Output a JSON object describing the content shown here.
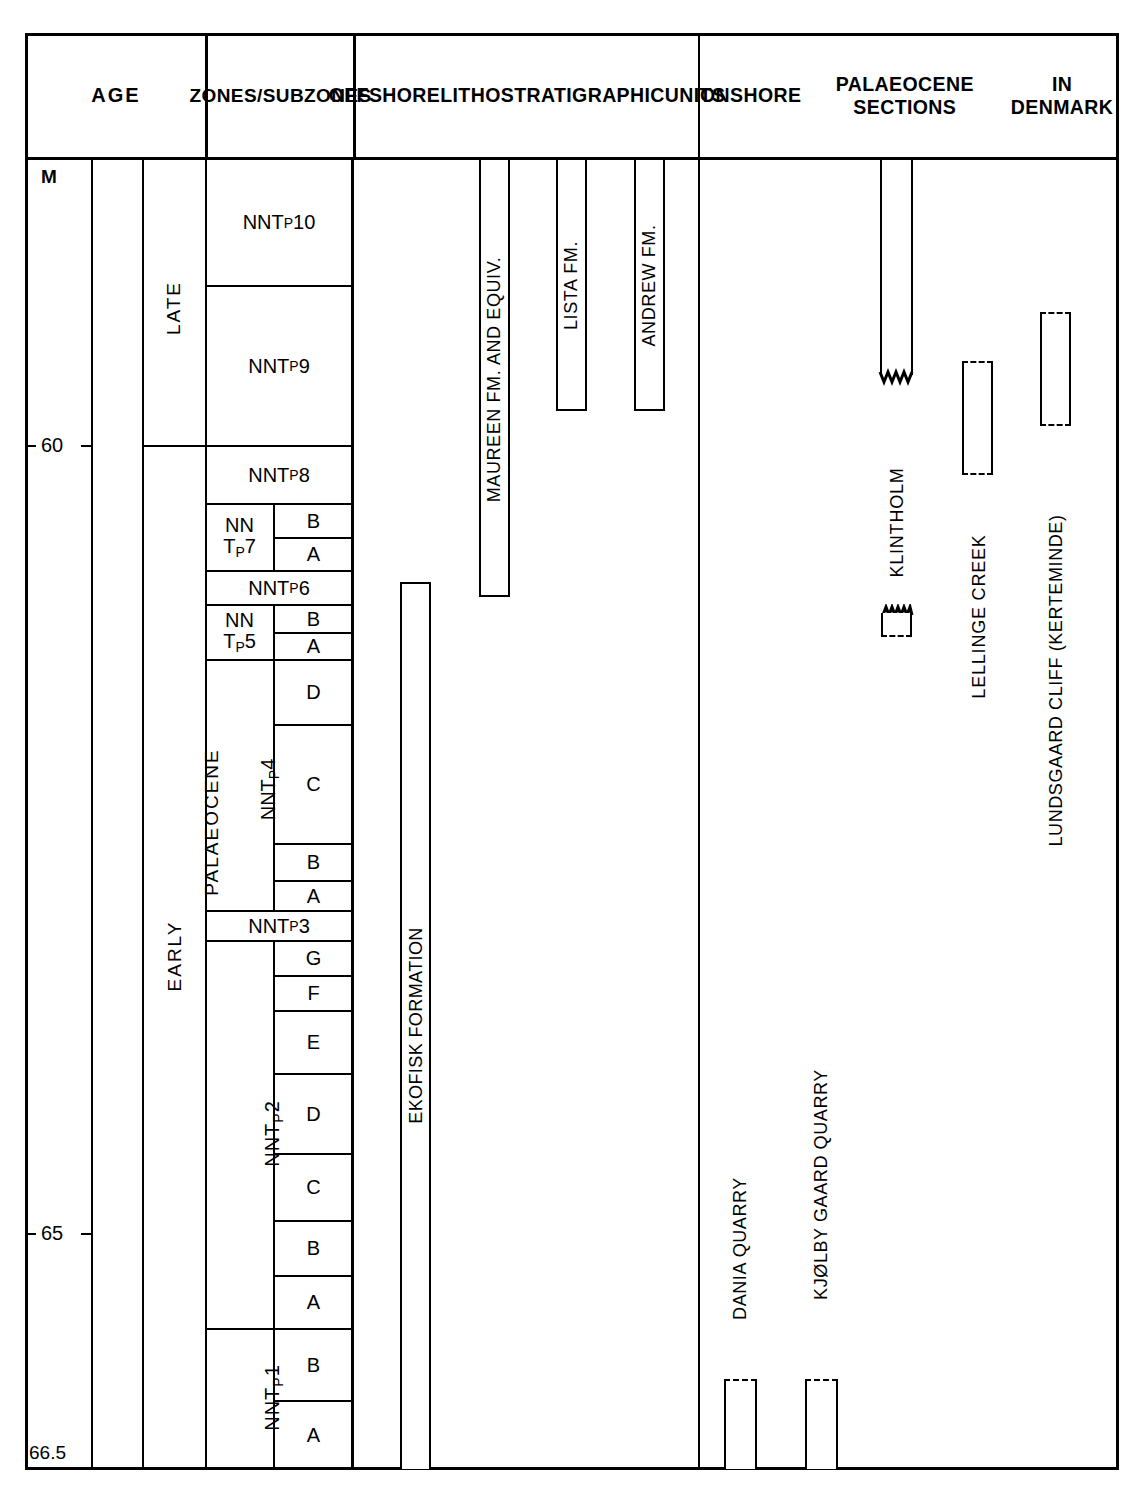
{
  "figure": {
    "type": "stratigraphic_correlation_chart",
    "background": "#ffffff",
    "line_color": "#000000"
  },
  "headers": {
    "age": "AGE",
    "zones": "ZONES/\nSUBZONES",
    "offshore": "OFFSHORE\nLITHOSTRATIGRAPHIC\nUNITS",
    "onshore": "ONSHORE\nPALAEOCENE SECTIONS\nIN DENMARK"
  },
  "axis": {
    "unit_label": "M",
    "ticks": [
      {
        "label": "60",
        "value": 60
      },
      {
        "label": "65",
        "value": 65
      }
    ],
    "bottom_label": "66.5",
    "top_value": 58.0,
    "bottom_value": 66.5
  },
  "age": {
    "system": "PALAEOCENE",
    "epochs": [
      {
        "label": "LATE"
      },
      {
        "label": "EARLY"
      }
    ]
  },
  "zones": [
    {
      "zone": "NNT",
      "sub": "P",
      "num": "10",
      "subzones": []
    },
    {
      "zone": "NNT",
      "sub": "P",
      "num": "9",
      "subzones": []
    },
    {
      "zone": "NNT",
      "sub": "P",
      "num": "8",
      "subzones": []
    },
    {
      "zone": "NN\nT",
      "sub": "P",
      "num": "7",
      "subzones": [
        "B",
        "A"
      ]
    },
    {
      "zone": "NNT",
      "sub": "P",
      "num": "6",
      "subzones": []
    },
    {
      "zone": "NN\nT",
      "sub": "P",
      "num": "5",
      "subzones": [
        "B",
        "A"
      ]
    },
    {
      "zone": "NNT",
      "sub": "P",
      "num": "4",
      "subzones": [
        "D",
        "C",
        "B",
        "A"
      ]
    },
    {
      "zone": "NNT",
      "sub": "P",
      "num": "3",
      "subzones": []
    },
    {
      "zone": "NNT",
      "sub": "P",
      "num": "2",
      "subzones": [
        "G",
        "F",
        "E",
        "D",
        "C",
        "B",
        "A"
      ]
    },
    {
      "zone": "NNT",
      "sub": "P",
      "num": "1",
      "subzones": [
        "B",
        "A"
      ]
    }
  ],
  "zone_labels": {
    "p10": "NNT",
    "p10n": "10",
    "p9": "NNT",
    "p9n": "9",
    "p8": "NNT",
    "p8n": "8",
    "p7a": "NN",
    "p7b": "T",
    "p7n": "7",
    "p6": "NNT",
    "p6n": "6",
    "p5a": "NN",
    "p5b": "T",
    "p5n": "5",
    "p4": "NNT",
    "p4n": "4",
    "p3": "NNT",
    "p3n": "3",
    "p2": "NNT",
    "p2n": "2",
    "p1": "NNT",
    "p1n": "1",
    "sub_p": "P"
  },
  "subzone_cells": {
    "p7_B": "B",
    "p7_A": "A",
    "p5_B": "B",
    "p5_A": "A",
    "p4_D": "D",
    "p4_C": "C",
    "p4_B": "B",
    "p4_A": "A",
    "p2_G": "G",
    "p2_F": "F",
    "p2_E": "E",
    "p2_D": "D",
    "p2_C": "C",
    "p2_B": "B",
    "p2_A": "A",
    "p1_B": "B",
    "p1_A": "A"
  },
  "offshore_units": [
    {
      "name": "MAUREEN FM. AND EQUIV.",
      "top": "58.0",
      "base": "61.9",
      "style": "solid"
    },
    {
      "name": "LISTA FM.",
      "top": "58.0",
      "base": "60.5",
      "style": "solid"
    },
    {
      "name": "ANDREW FM.",
      "top": "58.0",
      "base": "60.5",
      "style": "solid"
    },
    {
      "name": "EKOFISK FORMATION",
      "top": "61.8",
      "base": "66.5",
      "style": "solid"
    }
  ],
  "onshore_sections": [
    {
      "name": "DANIA QUARRY",
      "top_style": "dashed",
      "base_style": "open"
    },
    {
      "name": "KJØLBY GAARD QUARRY",
      "top_style": "dashed",
      "base_style": "open"
    },
    {
      "name": "KLINTHOLM",
      "top_style": "open",
      "base_style": "zigzag"
    },
    {
      "name": "KLINTHOLM (lower)",
      "top_style": "zigzag",
      "base_style": "dashed"
    },
    {
      "name": "LELLINGE CREEK",
      "top_style": "dashed",
      "base_style": "dashed"
    },
    {
      "name": "LUNDSGAARD CLIFF (KERTEMINDE)",
      "top_style": "dashed",
      "base_style": "dashed"
    }
  ],
  "onshore_names": {
    "dania": "DANIA QUARRY",
    "kjolby": "KJØLBY GAARD QUARRY",
    "klintholm": "KLINTHOLM",
    "lellinge": "LELLINGE CREEK",
    "lundsgaard": "LUNDSGAARD CLIFF (KERTEMINDE)"
  },
  "offshore_names": {
    "maureen": "MAUREEN FM. AND EQUIV.",
    "lista": "LISTA FM.",
    "andrew": "ANDREW FM.",
    "ekofisk": "EKOFISK FORMATION"
  },
  "chart_data": {
    "type": "table",
    "xlabel": "",
    "ylabel": "Age (Ma)",
    "ylim": [
      58.0,
      66.5
    ],
    "grid": false,
    "legend": "none",
    "axis_ticks": [
      60,
      65,
      66.5
    ],
    "columns": [
      "AGE",
      "ZONES/SUBZONES",
      "OFFSHORE LITHOSTRATIGRAPHIC UNITS",
      "ONSHORE PALAEOCENE SECTIONS IN DENMARK"
    ],
    "series": [
      {
        "name": "Zone boundaries (Ma)",
        "categories": [
          "NNTp10",
          "NNTp9",
          "NNTp8",
          "NNTp7B",
          "NNTp7A",
          "NNTp6",
          "NNTp5B",
          "NNTp5A",
          "NNTp4D",
          "NNTp4C",
          "NNTp4B",
          "NNTp4A",
          "NNTp3",
          "NNTp2G",
          "NNTp2F",
          "NNTp2E",
          "NNTp2D",
          "NNTp2C",
          "NNTp2B",
          "NNTp2A",
          "NNTp1B",
          "NNTp1A"
        ],
        "values": [
          58.6,
          60.0,
          60.4,
          60.7,
          60.9,
          61.2,
          61.4,
          61.6,
          62.2,
          63.2,
          63.4,
          63.6,
          63.9,
          64.1,
          64.3,
          64.7,
          65.1,
          65.4,
          65.7,
          66.0,
          66.25,
          66.5
        ]
      }
    ]
  }
}
